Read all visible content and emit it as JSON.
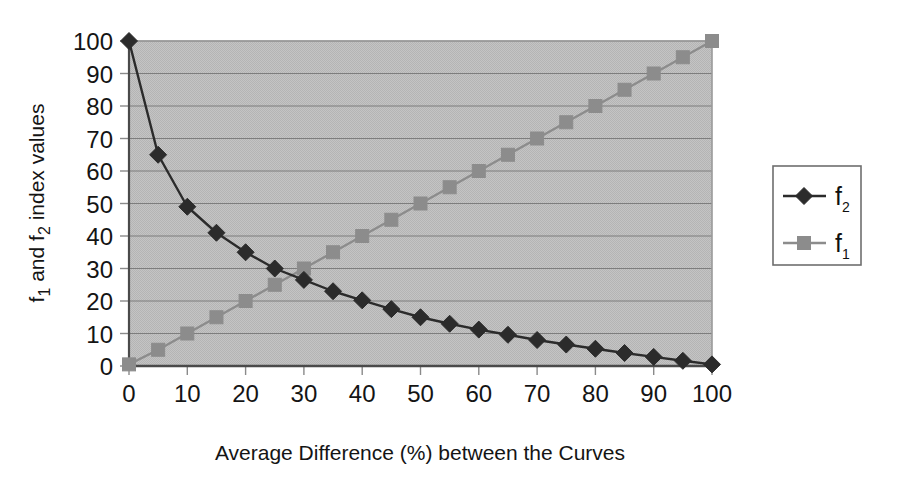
{
  "chart_data": {
    "type": "line",
    "title": "",
    "xlabel": "Average Difference (%) between the Curves",
    "ylabel": "f1 and f2 index values",
    "ylabel_parts": {
      "p1": "f",
      "p1_sub": "1",
      "p2": " and f",
      "p2_sub": "2",
      "p3": " index values"
    },
    "xlim": [
      0,
      100
    ],
    "ylim": [
      0,
      100
    ],
    "xticks": [
      0,
      10,
      20,
      30,
      40,
      50,
      60,
      70,
      80,
      90,
      100
    ],
    "yticks": [
      0,
      10,
      20,
      30,
      40,
      50,
      60,
      70,
      80,
      90,
      100
    ],
    "xtick_labels": [
      "0",
      "10",
      "20",
      "30",
      "40",
      "50",
      "60",
      "70",
      "80",
      "90",
      "100"
    ],
    "ytick_labels": [
      "0",
      "10",
      "20",
      "30",
      "40",
      "50",
      "60",
      "70",
      "80",
      "90",
      "100"
    ],
    "grid": "horizontal",
    "legend_position": "right-outside",
    "plot_bgcolor": "#bfbfbf",
    "x": [
      0,
      5,
      10,
      15,
      20,
      25,
      30,
      35,
      40,
      45,
      50,
      55,
      60,
      65,
      70,
      75,
      80,
      85,
      90,
      95,
      100
    ],
    "series": [
      {
        "name": "f2",
        "name_base": "f",
        "name_sub": "2",
        "marker": "diamond",
        "color": "#2b2b2b",
        "values": [
          100,
          65,
          49,
          41,
          35,
          30,
          26.5,
          23,
          20.2,
          17.5,
          15,
          13,
          11.2,
          9.6,
          8,
          6.6,
          5.3,
          4,
          2.8,
          1.6,
          0.5
        ]
      },
      {
        "name": "f1",
        "name_base": "f",
        "name_sub": "1",
        "marker": "square",
        "color": "#8c8c8c",
        "values": [
          0.5,
          5,
          10,
          15,
          20,
          25,
          30,
          35,
          40,
          45,
          50,
          55,
          60,
          65,
          70,
          75,
          80,
          85,
          90,
          95,
          100
        ]
      }
    ]
  },
  "legend": {
    "entries": [
      {
        "label_base": "f",
        "label_sub": "2",
        "marker": "diamond",
        "color": "#2b2b2b"
      },
      {
        "label_base": "f",
        "label_sub": "1",
        "marker": "square",
        "color": "#8c8c8c"
      }
    ]
  }
}
